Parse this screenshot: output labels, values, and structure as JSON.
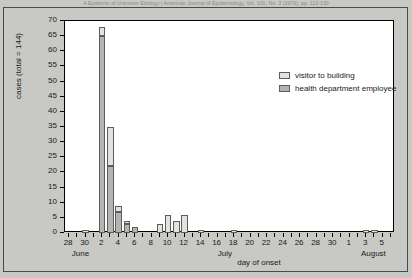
{
  "header": {
    "journal_line": "A Epidemic of Unknown Etiology  |  American Journal of Epidemiology, Vol. 101, No. 3 (1976), pp. 112-130"
  },
  "chart_data": {
    "type": "bar",
    "title": "",
    "xlabel": "day of onset",
    "ylabel": "cases (total = 144)",
    "ylim": [
      0,
      70
    ],
    "ytick_step": 5,
    "yticks": [
      0,
      5,
      10,
      15,
      20,
      25,
      30,
      35,
      40,
      45,
      50,
      55,
      60,
      65,
      70
    ],
    "grid": false,
    "legend_position": "top-right",
    "stacked": true,
    "colors": {
      "visitor": "#e2e2e0",
      "employee": "#b4b4b2",
      "bar_outline": "#5d5d5b",
      "axis": "#000000",
      "plot_background": "#ffffff",
      "page_background": "#c8c8c4"
    },
    "series": [
      {
        "name": "visitor to building",
        "key": "visitor"
      },
      {
        "name": "health department  employee",
        "key": "employee"
      }
    ],
    "months": [
      {
        "label": "June",
        "start_index": 0,
        "end_index": 3
      },
      {
        "label": "July",
        "start_index": 4,
        "end_index": 34
      },
      {
        "label": "August",
        "start_index": 35,
        "end_index": 39
      }
    ],
    "categories": [
      "Jun 28",
      "Jun 29",
      "Jun 30",
      "Jul 1",
      "Jul 2",
      "Jul 3",
      "Jul 4",
      "Jul 5",
      "Jul 6",
      "Jul 7",
      "Jul 8",
      "Jul 9",
      "Jul 10",
      "Jul 11",
      "Jul 12",
      "Jul 13",
      "Jul 14",
      "Jul 15",
      "Jul 16",
      "Jul 17",
      "Jul 18",
      "Jul 19",
      "Jul 20",
      "Jul 21",
      "Jul 22",
      "Jul 23",
      "Jul 24",
      "Jul 25",
      "Jul 26",
      "Jul 27",
      "Jul 28",
      "Jul 29",
      "Jul 30",
      "Jul 31",
      "Aug 1",
      "Aug 2",
      "Aug 3",
      "Aug 4",
      "Aug 5",
      "Aug 6"
    ],
    "tick_labels": [
      "28",
      "",
      "30",
      "",
      "2",
      "",
      "4",
      "",
      "6",
      "",
      "8",
      "",
      "10",
      "",
      "12",
      "",
      "14",
      "",
      "16",
      "",
      "18",
      "",
      "20",
      "",
      "22",
      "",
      "24",
      "",
      "26",
      "",
      "28",
      "",
      "30",
      "",
      "1",
      "",
      "3",
      "",
      "5",
      ""
    ],
    "values": {
      "visitor": [
        0,
        0,
        1,
        0,
        3,
        13,
        2,
        1,
        0,
        0,
        0,
        3,
        6,
        4,
        6,
        0,
        1,
        0,
        0,
        0,
        1,
        0,
        0,
        0,
        0,
        0,
        0,
        0,
        0,
        0,
        0,
        0,
        0,
        0,
        0,
        0,
        1,
        1,
        0,
        0
      ],
      "employee": [
        0,
        0,
        0,
        0,
        65,
        22,
        7,
        3,
        2,
        0,
        0,
        0,
        0,
        0,
        0,
        0,
        0,
        0,
        0,
        0,
        0,
        0,
        0,
        0,
        0,
        0,
        0,
        0,
        0,
        0,
        0,
        0,
        0,
        0,
        0,
        0,
        0,
        0,
        0,
        0
      ]
    },
    "totals_note": "total = 144"
  }
}
